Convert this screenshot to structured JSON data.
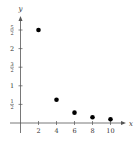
{
  "chart_data": {
    "type": "scatter",
    "title": "",
    "xlabel": "x",
    "ylabel": "y",
    "x": [
      2,
      4,
      6,
      8,
      10
    ],
    "y": [
      2.5,
      0.625,
      0.278,
      0.156,
      0.1
    ],
    "x_ticks": [
      2,
      4,
      6,
      8,
      10
    ],
    "x_tick_labels": [
      "2",
      "4",
      "6",
      "8",
      "10"
    ],
    "y_ticks": [
      0.5,
      1,
      1.5,
      2,
      2.5
    ],
    "y_tick_labels": [
      {
        "num": "1",
        "den": "2"
      },
      {
        "whole": "1"
      },
      {
        "num": "3",
        "den": "2"
      },
      {
        "whole": "2"
      },
      {
        "num": "5",
        "den": "2"
      }
    ],
    "xlim": [
      0,
      11
    ],
    "ylim": [
      0,
      2.9
    ],
    "grid": false,
    "legend": null,
    "marker_color": "#000000"
  }
}
